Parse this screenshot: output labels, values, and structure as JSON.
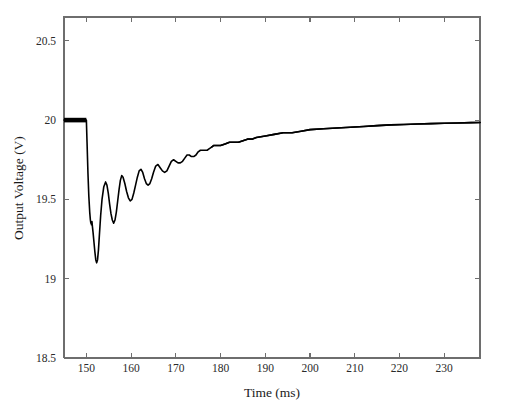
{
  "chart_data": {
    "type": "line",
    "title": "",
    "xlabel": "Time (ms)",
    "ylabel": "Output Voltage (V)",
    "xlim": [
      145,
      238
    ],
    "ylim": [
      18.5,
      20.65
    ],
    "xticks": [
      150,
      160,
      170,
      180,
      190,
      200,
      210,
      220,
      230
    ],
    "xtick_labels": [
      "150",
      "160",
      "170",
      "180",
      "190",
      "200",
      "210",
      "220",
      "230"
    ],
    "yticks": [
      18.5,
      19,
      19.5,
      20,
      20.5
    ],
    "ytick_labels": [
      "18.5",
      "19",
      "19.5",
      "20",
      "20.5"
    ],
    "grid": false,
    "legend": "none",
    "line_color": "#000000",
    "frame_color": "#6e6e6e",
    "background": "#ffffff",
    "annotations": [
      "Steady state at 20 V before the load step at t = 150 ms",
      "Sharp undershoot to about 19.10 V at t = 152 ms",
      "Damped ringing with period of roughly 2.5 ms decaying through t = 185 ms",
      "Exponential recovery asymptoting to about 19.98 V by t = 238 ms"
    ],
    "series": [
      {
        "name": "Output Voltage",
        "x": [
          145.0,
          146.0,
          147.0,
          148.0,
          149.0,
          149.7,
          149.9,
          150.0,
          150.15,
          150.35,
          150.55,
          150.75,
          150.9,
          151.0,
          151.05,
          151.15,
          151.25,
          151.35,
          151.5,
          151.7,
          151.9,
          152.1,
          152.3,
          152.5,
          152.7,
          152.9,
          153.2,
          153.5,
          153.9,
          154.3,
          154.6,
          154.9,
          155.2,
          155.5,
          155.8,
          156.1,
          156.4,
          156.7,
          157.0,
          157.3,
          157.6,
          157.9,
          158.2,
          158.6,
          159.0,
          159.4,
          159.8,
          160.2,
          160.6,
          161.0,
          161.4,
          161.8,
          162.2,
          162.6,
          163.0,
          163.4,
          163.8,
          164.2,
          164.6,
          165.0,
          165.5,
          166.0,
          166.5,
          167.0,
          167.5,
          168.0,
          168.5,
          169.0,
          169.5,
          170.0,
          170.5,
          171.0,
          171.5,
          172.0,
          172.5,
          173.0,
          173.5,
          174.0,
          174.5,
          175.0,
          175.5,
          176.0,
          176.5,
          177.0,
          177.5,
          178.0,
          178.5,
          179.0,
          179.5,
          180.0,
          181.0,
          182.0,
          183.0,
          184.0,
          185.0,
          186.0,
          187.0,
          188.0,
          190.0,
          192.0,
          194.0,
          196.0,
          198.0,
          200.0,
          203.0,
          206.0,
          209.0,
          212.0,
          215.0,
          218.0,
          221.0,
          224.0,
          227.0,
          230.0,
          233.0,
          236.0,
          238.0
        ],
        "y": [
          20.0,
          20.0,
          20.0,
          20.0,
          20.0,
          20.0,
          20.0,
          20.0,
          19.86,
          19.67,
          19.52,
          19.42,
          19.37,
          19.35,
          19.36,
          19.34,
          19.36,
          19.33,
          19.29,
          19.23,
          19.17,
          19.12,
          19.1,
          19.12,
          19.18,
          19.27,
          19.4,
          19.5,
          19.58,
          19.61,
          19.59,
          19.54,
          19.47,
          19.41,
          19.37,
          19.35,
          19.37,
          19.42,
          19.49,
          19.56,
          19.62,
          19.65,
          19.64,
          19.6,
          19.55,
          19.51,
          19.49,
          19.5,
          19.54,
          19.59,
          19.64,
          19.68,
          19.69,
          19.67,
          19.63,
          19.6,
          19.59,
          19.6,
          19.63,
          19.67,
          19.71,
          19.72,
          19.7,
          19.68,
          19.67,
          19.68,
          19.71,
          19.74,
          19.75,
          19.74,
          19.73,
          19.73,
          19.74,
          19.76,
          19.78,
          19.78,
          19.77,
          19.77,
          19.78,
          19.8,
          19.81,
          19.81,
          19.81,
          19.81,
          19.82,
          19.83,
          19.84,
          19.84,
          19.84,
          19.84,
          19.85,
          19.86,
          19.86,
          19.86,
          19.87,
          19.88,
          19.88,
          19.89,
          19.9,
          19.91,
          19.92,
          19.92,
          19.93,
          19.94,
          19.945,
          19.95,
          19.955,
          19.96,
          19.965,
          19.97,
          19.972,
          19.975,
          19.978,
          19.98,
          19.982,
          19.984,
          19.985
        ]
      }
    ]
  },
  "geometry": {
    "plot_left": 64,
    "plot_right": 480,
    "plot_top": 17,
    "plot_bottom": 358
  }
}
